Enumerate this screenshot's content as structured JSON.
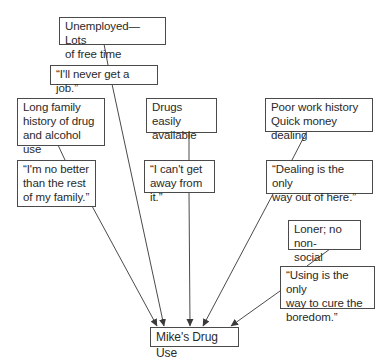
{
  "diagram": {
    "type": "causal-flow",
    "target": {
      "id": "outcome",
      "label": "Mike's Drug Use"
    },
    "chains": [
      {
        "id": "chain-1",
        "factor": "Unemployed—Lots\nof free time",
        "thought": "“I'll never get a job.”"
      },
      {
        "id": "chain-2",
        "factor": "Long family\nhistory of drug\nand alcohol use",
        "thought": "“I'm no better\nthan the rest\nof my family.”"
      },
      {
        "id": "chain-3",
        "factor": "Drugs easily\navailable",
        "thought": "“I can't get\naway from it.”"
      },
      {
        "id": "chain-4",
        "factor": "Poor work history\nQuick money dealing",
        "thought": "“Dealing is the only\nway out of here.”"
      },
      {
        "id": "chain-5",
        "factor": "Loner; no non-\nsocial support",
        "thought": "“Using is the only\nway to cure the\nboredom.”"
      }
    ],
    "colors": {
      "line": "#4a4a4a",
      "border": "#4a4a4a",
      "text": "#2a2a2a",
      "background": "#ffffff"
    }
  }
}
